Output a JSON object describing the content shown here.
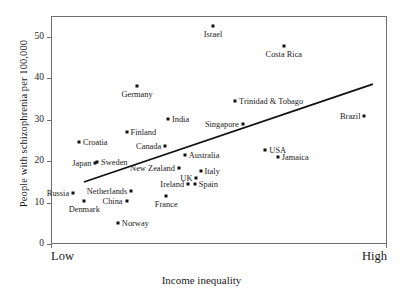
{
  "chart_data": {
    "type": "scatter",
    "title": "",
    "xlabel": "Income inequality",
    "ylabel": "People with schizophrenia per 100,000",
    "x_axis": {
      "low_label": "Low",
      "high_label": "High",
      "type": "ordinal-qualitative",
      "ticks": []
    },
    "y_axis": {
      "ticks": [
        0,
        10,
        20,
        30,
        40,
        50
      ],
      "tick_labels": [
        "0",
        "10",
        "20",
        "30",
        "40",
        "50"
      ],
      "ylim": [
        0,
        55
      ]
    },
    "grid": false,
    "legend": null,
    "trendline": {
      "present": true,
      "description": "positive linear fit",
      "x_start_frac": 0.095,
      "y_start": 15.2,
      "x_end_frac": 0.955,
      "y_end": 38.8
    },
    "points": [
      {
        "label": "Israel",
        "x_frac": 0.479,
        "y": 52.8,
        "lx": 0.479,
        "ly": 52.8,
        "pos": "below"
      },
      {
        "label": "Costa Rica",
        "x_frac": 0.69,
        "y": 48.1,
        "lx": 0.69,
        "ly": 48.1,
        "pos": "below"
      },
      {
        "label": "Germany",
        "x_frac": 0.253,
        "y": 38.4,
        "lx": 0.253,
        "ly": 38.4,
        "pos": "below"
      },
      {
        "label": "Trinidad & Tobago",
        "x_frac": 0.545,
        "y": 34.8,
        "lx": 0.545,
        "ly": 34.8,
        "pos": "right"
      },
      {
        "label": "Brazil",
        "x_frac": 0.93,
        "y": 31.0,
        "lx": 0.93,
        "ly": 31.0,
        "pos": "left"
      },
      {
        "label": "India",
        "x_frac": 0.345,
        "y": 30.5,
        "lx": 0.345,
        "ly": 30.5,
        "pos": "right"
      },
      {
        "label": "Singapore",
        "x_frac": 0.568,
        "y": 29.1,
        "lx": 0.568,
        "ly": 29.1,
        "pos": "left"
      },
      {
        "label": "Finland",
        "x_frac": 0.222,
        "y": 27.3,
        "lx": 0.222,
        "ly": 27.3,
        "pos": "right"
      },
      {
        "label": "Croatia",
        "x_frac": 0.08,
        "y": 24.8,
        "lx": 0.08,
        "ly": 24.8,
        "pos": "right"
      },
      {
        "label": "Canada",
        "x_frac": 0.337,
        "y": 23.8,
        "lx": 0.337,
        "ly": 23.8,
        "pos": "left"
      },
      {
        "label": "USA",
        "x_frac": 0.635,
        "y": 22.9,
        "lx": 0.635,
        "ly": 22.9,
        "pos": "right"
      },
      {
        "label": "Australia",
        "x_frac": 0.395,
        "y": 21.7,
        "lx": 0.395,
        "ly": 21.7,
        "pos": "right"
      },
      {
        "label": "Jamaica",
        "x_frac": 0.672,
        "y": 21.2,
        "lx": 0.672,
        "ly": 21.2,
        "pos": "right"
      },
      {
        "label": "Sweden",
        "x_frac": 0.134,
        "y": 20.1,
        "lx": 0.134,
        "ly": 20.1,
        "pos": "right"
      },
      {
        "label": "Japan",
        "x_frac": 0.129,
        "y": 19.8,
        "lx": 0.129,
        "ly": 19.8,
        "pos": "left"
      },
      {
        "label": "New Zealand",
        "x_frac": 0.378,
        "y": 18.6,
        "lx": 0.378,
        "ly": 18.6,
        "pos": "left"
      },
      {
        "label": "Italy",
        "x_frac": 0.442,
        "y": 17.8,
        "lx": 0.442,
        "ly": 17.8,
        "pos": "right"
      },
      {
        "label": "UK",
        "x_frac": 0.43,
        "y": 16.1,
        "lx": 0.43,
        "ly": 16.1,
        "pos": "left"
      },
      {
        "label": "Spain",
        "x_frac": 0.425,
        "y": 14.6,
        "lx": 0.425,
        "ly": 14.6,
        "pos": "right"
      },
      {
        "label": "Ireland",
        "x_frac": 0.405,
        "y": 14.8,
        "lx": 0.405,
        "ly": 14.8,
        "pos": "left"
      },
      {
        "label": "Netherlands",
        "x_frac": 0.236,
        "y": 13.1,
        "lx": 0.236,
        "ly": 13.1,
        "pos": "left"
      },
      {
        "label": "Russia",
        "x_frac": 0.063,
        "y": 12.6,
        "lx": 0.063,
        "ly": 12.6,
        "pos": "left"
      },
      {
        "label": "France",
        "x_frac": 0.34,
        "y": 11.8,
        "lx": 0.34,
        "ly": 11.8,
        "pos": "below"
      },
      {
        "label": "China",
        "x_frac": 0.222,
        "y": 10.6,
        "lx": 0.222,
        "ly": 10.6,
        "pos": "left"
      },
      {
        "label": "Denmark",
        "x_frac": 0.096,
        "y": 10.7,
        "lx": 0.096,
        "ly": 10.7,
        "pos": "below"
      },
      {
        "label": "Norway",
        "x_frac": 0.196,
        "y": 5.2,
        "lx": 0.196,
        "ly": 5.2,
        "pos": "right"
      }
    ]
  }
}
